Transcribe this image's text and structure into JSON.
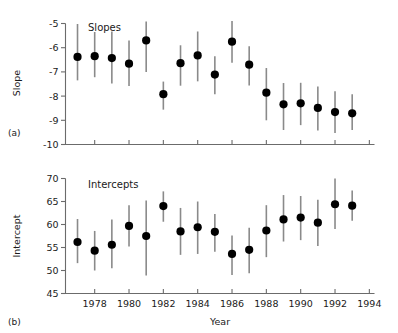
{
  "figure": {
    "panel_a": {
      "tag": "(a)",
      "title": "Slopes",
      "ylabel": "Slope",
      "yticks": [
        "-5",
        "-6",
        "-7",
        "-8",
        "-9",
        "-10"
      ],
      "ytick_values": [
        -5,
        -6,
        -7,
        -8,
        -9,
        -10
      ],
      "ylim": [
        -10,
        -5
      ]
    },
    "panel_b": {
      "tag": "(b)",
      "title": "Intercepts",
      "ylabel": "Intercept",
      "yticks": [
        "70",
        "65",
        "60",
        "55",
        "50",
        "45"
      ],
      "ytick_values": [
        70,
        65,
        60,
        55,
        50,
        45
      ],
      "ylim": [
        45,
        70
      ]
    },
    "xlabel": "Year",
    "xticks": [
      "1978",
      "1980",
      "1982",
      "1984",
      "1986",
      "1988",
      "1990",
      "1992",
      "1994"
    ],
    "xtick_values": [
      1978,
      1980,
      1982,
      1984,
      1986,
      1988,
      1990,
      1992,
      1994
    ],
    "xlim": [
      1976.3,
      1994.3
    ]
  },
  "chart_data": [
    {
      "type": "scatter",
      "id": "panel-a-slopes",
      "title": "Slopes",
      "xlabel": "Year",
      "ylabel": "Slope",
      "xlim": [
        1976.3,
        1994.3
      ],
      "ylim": [
        -10,
        -5
      ],
      "grid": false,
      "legend": null,
      "errorbars": "vertical",
      "x": [
        1977,
        1978,
        1979,
        1980,
        1981,
        1982,
        1983,
        1984,
        1985,
        1986,
        1987,
        1988,
        1989,
        1990,
        1991,
        1992,
        1993
      ],
      "values": [
        -6.38,
        -6.35,
        -6.43,
        -6.66,
        -5.7,
        -7.92,
        -6.64,
        -6.32,
        -7.11,
        -5.75,
        -6.7,
        -7.86,
        -8.34,
        -8.3,
        -8.49,
        -8.66,
        -8.71
      ],
      "err_low": [
        -7.35,
        -7.22,
        -7.48,
        -7.58,
        -7.0,
        -8.56,
        -7.57,
        -7.39,
        -7.92,
        -6.62,
        -7.56,
        -9.0,
        -9.4,
        -9.2,
        -9.42,
        -9.52,
        -9.4
      ],
      "err_high": [
        -5.02,
        -5.35,
        -5.33,
        -5.7,
        -4.92,
        -7.4,
        -5.9,
        -5.33,
        -6.35,
        -4.9,
        -5.94,
        -6.84,
        -7.46,
        -7.45,
        -7.6,
        -7.8,
        -7.92
      ]
    },
    {
      "type": "scatter",
      "id": "panel-b-intercepts",
      "title": "Intercepts",
      "xlabel": "Year",
      "ylabel": "Intercept",
      "xlim": [
        1976.3,
        1994.3
      ],
      "ylim": [
        45,
        70
      ],
      "grid": false,
      "legend": null,
      "errorbars": "vertical",
      "x": [
        1977,
        1978,
        1979,
        1980,
        1981,
        1982,
        1983,
        1984,
        1985,
        1986,
        1987,
        1988,
        1989,
        1990,
        1991,
        1992,
        1993
      ],
      "values": [
        56.2,
        54.3,
        55.6,
        59.7,
        57.5,
        64.0,
        58.5,
        59.4,
        58.4,
        53.6,
        54.5,
        58.7,
        61.1,
        61.5,
        60.4,
        64.4,
        64.1
      ],
      "err_low": [
        51.6,
        50.0,
        50.5,
        55.2,
        48.9,
        60.6,
        53.4,
        53.6,
        54.1,
        49.0,
        49.4,
        52.9,
        56.3,
        56.6,
        55.3,
        59.0,
        60.8
      ],
      "err_high": [
        61.2,
        58.6,
        61.1,
        64.2,
        65.2,
        67.2,
        63.6,
        65.0,
        62.3,
        57.6,
        59.3,
        64.2,
        66.4,
        66.2,
        65.4,
        70.0,
        67.4
      ]
    }
  ]
}
